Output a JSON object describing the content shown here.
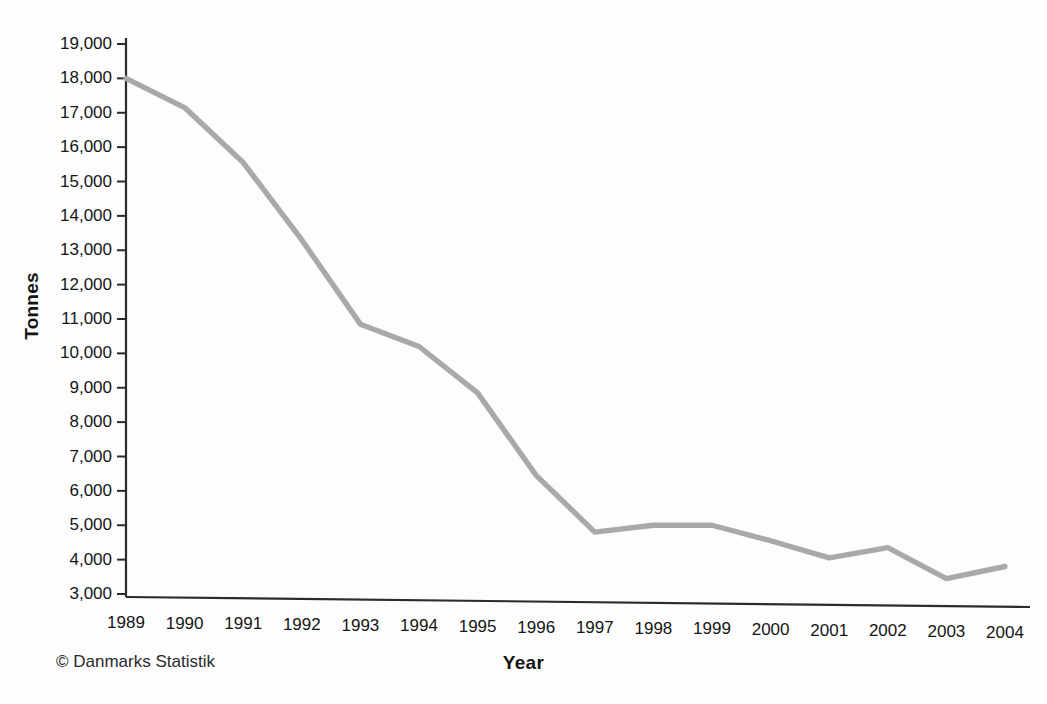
{
  "chart_data": {
    "type": "line",
    "title": "",
    "subtitle": "",
    "xlabel": "Year",
    "ylabel": "Tonnes",
    "categories": [
      "1989",
      "1990",
      "1991",
      "1992",
      "1993",
      "1994",
      "1995",
      "1996",
      "1997",
      "1998",
      "1999",
      "2000",
      "2001",
      "2002",
      "2003",
      "2004"
    ],
    "x": [
      1989,
      1990,
      1991,
      1992,
      1993,
      1994,
      1995,
      1996,
      1997,
      1998,
      1999,
      2000,
      2001,
      2002,
      2003,
      2004
    ],
    "values": [
      18000,
      17150,
      15550,
      13300,
      10850,
      10200,
      8850,
      6450,
      4800,
      5000,
      5000,
      4550,
      4050,
      4350,
      3450,
      3800
    ],
    "series": [
      {
        "name": "Tonnes",
        "color": "#a9a9a9",
        "values": [
          18000,
          17150,
          15550,
          13300,
          10850,
          10200,
          8850,
          6450,
          4800,
          5000,
          5000,
          4550,
          4050,
          4350,
          3450,
          3800
        ]
      }
    ],
    "ylim": [
      3000,
      19000
    ],
    "ytick_values": [
      3000,
      4000,
      5000,
      6000,
      7000,
      8000,
      9000,
      10000,
      11000,
      12000,
      13000,
      14000,
      15000,
      16000,
      17000,
      18000,
      19000
    ],
    "ytick_labels": [
      "3,000",
      "4,000",
      "5,000",
      "6,000",
      "7,000",
      "8,000",
      "9,000",
      "10,000",
      "11,000",
      "12,000",
      "13,000",
      "14,000",
      "15,000",
      "16,000",
      "17,000",
      "18,000",
      "19,000"
    ],
    "xlim": [
      1989,
      2004
    ],
    "grid": false,
    "legend": false,
    "legend_position": "none"
  },
  "annotations": {
    "credit": "© Danmarks Statistik"
  },
  "style": {
    "line_color": "#a9a9a9",
    "axis_color": "#2b2b2b",
    "text_color": "#141414",
    "background": "#fdfdfd"
  }
}
